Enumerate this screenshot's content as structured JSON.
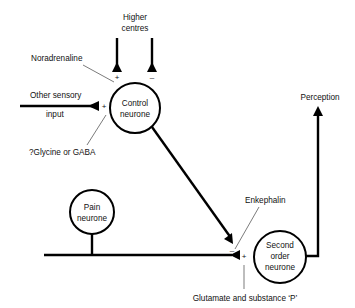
{
  "diagram": {
    "type": "gate-control-theory-of-pain",
    "nodes": {
      "control_neurone": {
        "line1": "Control",
        "line2": "neurone"
      },
      "pain_neurone": {
        "line1": "Pain",
        "line2": "neurone"
      },
      "second_order_neurone": {
        "line1": "Second",
        "line2": "order",
        "line3": "neurone"
      }
    },
    "labels": {
      "higher_centres_1": "Higher",
      "higher_centres_2": "centres",
      "noradrenaline": "Noradrenaline",
      "other_sensory_1": "Other sensory",
      "other_sensory_2": "input",
      "glycine_gaba": "?Glycine or GABA",
      "perception": "Perception",
      "enkephalin": "Enkephalin",
      "glutamate": "Glutamate and substance ‘P’"
    },
    "signs": {
      "higher_plus": "+",
      "higher_minus": "–",
      "sensory_plus": "+",
      "control_minus": "–",
      "pain_plus": "+"
    },
    "edges": [
      {
        "from": "Higher centres",
        "to": "Control neurone",
        "sign": "+",
        "transmitter": "Noradrenaline"
      },
      {
        "from": "Higher centres",
        "to": "Control neurone",
        "sign": "-"
      },
      {
        "from": "Other sensory input",
        "to": "Control neurone",
        "sign": "+",
        "transmitter": "?Glycine or GABA"
      },
      {
        "from": "Control neurone",
        "to": "Second order neurone",
        "sign": "-",
        "transmitter": "Enkephalin"
      },
      {
        "from": "Pain neurone",
        "to": "Second order neurone",
        "sign": "+",
        "transmitter": "Glutamate and substance 'P'"
      },
      {
        "from": "Second order neurone",
        "to": "Perception"
      }
    ]
  }
}
